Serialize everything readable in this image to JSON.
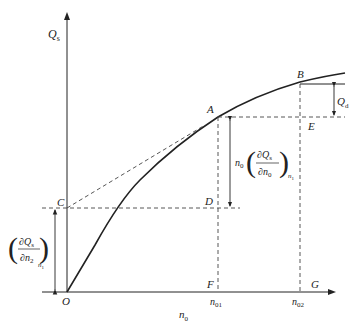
{
  "diagram": {
    "axes": {
      "y_label": "Q",
      "y_label_sub": "s",
      "x_label": "n",
      "x_label_sub": "0",
      "origin_label": "O"
    },
    "points": {
      "A": "A",
      "B": "B",
      "C": "C",
      "D": "D",
      "E": "E",
      "F": "F",
      "G": "G"
    },
    "ticks": {
      "n01": {
        "base": "n",
        "sub": "01"
      },
      "n02": {
        "base": "n",
        "sub": "02"
      }
    },
    "annotations": {
      "Qd": {
        "base": "Q",
        "sub": "d"
      },
      "AD_expression": {
        "prefix": "n",
        "prefix_sub": "0",
        "num": "∂Q",
        "num_sub": "s",
        "den": "∂n",
        "den_sub": "0",
        "outer_sub": "n",
        "outer_sub_sub": "1"
      },
      "OC_expression": {
        "num": "∂Q",
        "num_sub": "s",
        "den": "∂n",
        "den_sub": "2",
        "outer_sub": "n",
        "outer_sub_sub": "1"
      }
    },
    "colors": {
      "line": "#222222",
      "dashed": "#444444"
    }
  }
}
